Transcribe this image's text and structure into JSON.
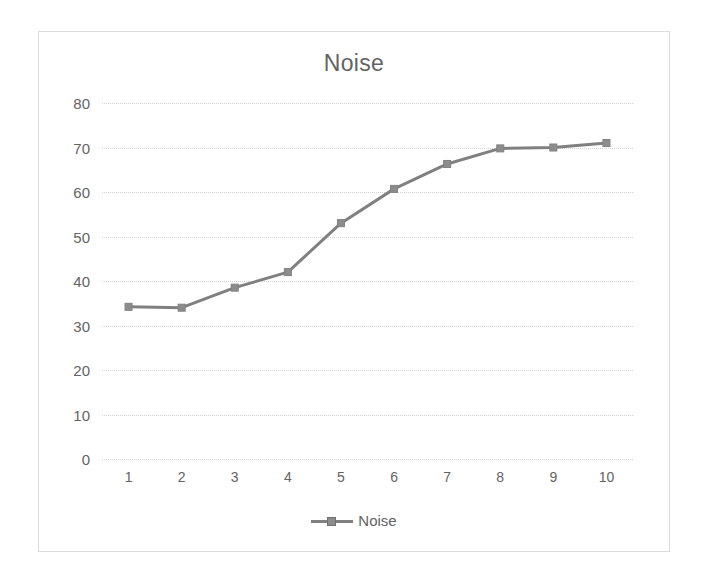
{
  "chart_data": {
    "type": "line",
    "title": "Noise",
    "xlabel": "",
    "ylabel": "",
    "categories": [
      "1",
      "2",
      "3",
      "4",
      "5",
      "6",
      "7",
      "8",
      "9",
      "10"
    ],
    "series": [
      {
        "name": "Noise",
        "values": [
          34.2,
          34.0,
          38.5,
          42.0,
          53.0,
          60.7,
          66.3,
          69.8,
          70.0,
          71.0
        ]
      }
    ],
    "ylim": [
      0,
      80
    ],
    "yticks": [
      0,
      10,
      20,
      30,
      40,
      50,
      60,
      70,
      80
    ],
    "ytick_labels": [
      "0",
      "10",
      "20",
      "30",
      "40",
      "50",
      "60",
      "70",
      "80"
    ],
    "grid": true,
    "legend_position": "bottom",
    "colors": {
      "series": "#808080",
      "marker": "#8c8c8c",
      "text": "#636363",
      "gridline": "#d2d2d2",
      "border": "#dcdcdc",
      "background": "#ffffff"
    }
  },
  "legend": {
    "entries": [
      {
        "label": "Noise",
        "marker": "line-marker-swatch"
      }
    ]
  }
}
